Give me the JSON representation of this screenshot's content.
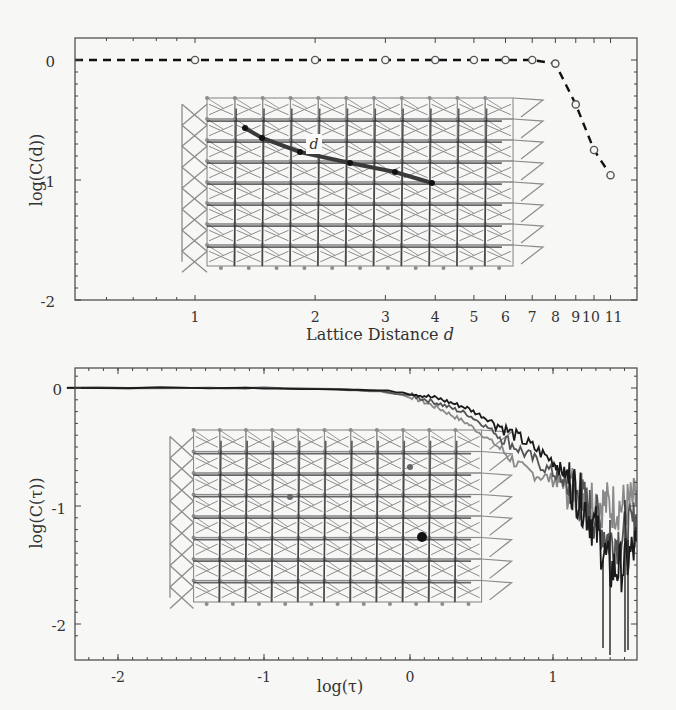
{
  "chart_data": [
    {
      "type": "line",
      "title": "",
      "xlabel": "Lattice Distance d",
      "ylabel": "log(C(d))",
      "xscale": "log",
      "x_ticks": [
        "1",
        "2",
        "3",
        "4",
        "5",
        "6",
        "7",
        "8",
        "9",
        "10",
        "11"
      ],
      "y_ticks": [
        "0",
        "-1",
        "-2"
      ],
      "ylim": [
        -2,
        0.15
      ],
      "grid": false,
      "legend": null,
      "series": [
        {
          "name": "C(d)",
          "style": "dashed black line with open circle markers",
          "x": [
            1,
            2,
            3,
            4,
            5,
            6,
            7,
            8,
            9,
            10,
            11
          ],
          "y": [
            0,
            0,
            0,
            0,
            0,
            0,
            0,
            -0.03,
            -0.37,
            -0.75,
            -0.96
          ]
        }
      ],
      "annotations": [
        {
          "type": "inset",
          "description": "lattice network diagram with a highlighted path labeled d"
        },
        {
          "type": "label",
          "text": "d"
        }
      ]
    },
    {
      "type": "line",
      "title": "",
      "xlabel": "log(τ)",
      "ylabel": "log(C(τ))",
      "x_ticks": [
        "-2",
        "-1",
        "0",
        "1"
      ],
      "y_ticks": [
        "0",
        "-1",
        "-2"
      ],
      "xlim": [
        -2.35,
        1.6
      ],
      "ylim": [
        -2.2,
        0.15
      ],
      "grid": false,
      "legend": null,
      "x": [
        -2.35,
        -1.5,
        -1.0,
        -0.5,
        -0.2,
        0.0,
        0.2,
        0.4,
        0.6,
        0.8,
        1.0,
        1.1,
        1.2,
        1.3,
        1.4,
        1.5,
        1.6
      ],
      "series": [
        {
          "name": "dark",
          "color": "#1a1a1a",
          "y": [
            0,
            0,
            0,
            -0.01,
            -0.02,
            -0.04,
            -0.09,
            -0.17,
            -0.3,
            -0.45,
            -0.62,
            -0.75,
            -0.95,
            -1.2,
            -1.55,
            -1.5,
            -1.3
          ]
        },
        {
          "name": "medium",
          "color": "#555555",
          "y": [
            0,
            0,
            0,
            -0.01,
            -0.03,
            -0.06,
            -0.13,
            -0.22,
            -0.38,
            -0.55,
            -0.72,
            -0.82,
            -0.95,
            -1.1,
            -1.3,
            -1.25,
            -1.1
          ]
        },
        {
          "name": "light",
          "color": "#8a8a8a",
          "y": [
            0,
            0,
            0,
            -0.01,
            -0.03,
            -0.07,
            -0.17,
            -0.3,
            -0.48,
            -0.7,
            -0.78,
            -0.82,
            -0.88,
            -0.95,
            -1.0,
            -1.0,
            -0.95
          ]
        }
      ],
      "annotations": [
        {
          "type": "inset",
          "description": "lattice network diagram with a highlighted node (black dot)"
        }
      ]
    }
  ],
  "top": {
    "xlabel_text": "Lattice Distance ",
    "xlabel_var": "d",
    "ylabel_text": "log(C(d))",
    "inset_label": "d",
    "y_tick_labels": [
      "0",
      "-1",
      "-2"
    ],
    "x_tick_labels": [
      "1",
      "2",
      "3",
      "4",
      "5",
      "6",
      "7",
      "8",
      "9",
      "10",
      "11"
    ]
  },
  "bottom": {
    "xlabel_text": "log(τ)",
    "ylabel_text": "log(C(τ))",
    "y_tick_labels": [
      "0",
      "-1",
      "-2"
    ],
    "x_tick_labels": [
      "-2",
      "-1",
      "0",
      "1"
    ]
  },
  "colors": {
    "background": "#f7f7f6",
    "axes": "#444444",
    "lattice_light": "#8c8c8c",
    "lattice_dark": "#2a2a2a"
  }
}
